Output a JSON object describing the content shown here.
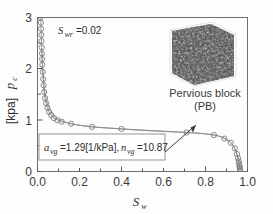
{
  "figure": {
    "background_color": "#fdfdfd",
    "frame_color": "#6f6f6f",
    "curve_color": "#8a8a8a",
    "marker_color": "#7d7d7d"
  },
  "chart_data": {
    "type": "line",
    "title": "",
    "xlabel": "S_w",
    "xlabel_main": "S",
    "xlabel_sub": "w",
    "ylabel": "p_c [kpa]",
    "ylabel_main": "p",
    "ylabel_sub": "c",
    "ylabel_unit": "[kpa]",
    "xlim": [
      0.0,
      1.0
    ],
    "ylim": [
      0,
      3
    ],
    "xticks": [
      0.0,
      0.2,
      0.4,
      0.6,
      0.8,
      1.0
    ],
    "xtick_labels": [
      "0.0",
      "0.2",
      "0.4",
      "0.6",
      "0.8",
      "1.0"
    ],
    "yticks": [
      0,
      1,
      2,
      3
    ],
    "ytick_labels": [
      "0",
      "1",
      "2",
      "3"
    ],
    "grid": false,
    "legend": "none",
    "series": [
      {
        "name": "Drainage branch (upper, dense markers)",
        "x": [
          0.015,
          0.016,
          0.017,
          0.018,
          0.019,
          0.02,
          0.021,
          0.022,
          0.023,
          0.025,
          0.027,
          0.029,
          0.032,
          0.036,
          0.041,
          0.047,
          0.055,
          0.065,
          0.078,
          0.095,
          0.115,
          0.16,
          0.26,
          0.4,
          0.71,
          0.84,
          0.89,
          0.92,
          0.94,
          0.95,
          0.955,
          0.958,
          0.96,
          0.962,
          0.963,
          0.964,
          0.965
        ],
        "y": [
          3.0,
          2.9,
          2.78,
          2.66,
          2.54,
          2.42,
          2.3,
          2.19,
          2.08,
          1.94,
          1.8,
          1.68,
          1.55,
          1.43,
          1.33,
          1.24,
          1.16,
          1.1,
          1.04,
          1.0,
          0.97,
          0.93,
          0.87,
          0.83,
          0.76,
          0.71,
          0.64,
          0.56,
          0.45,
          0.34,
          0.26,
          0.2,
          0.15,
          0.11,
          0.08,
          0.05,
          0.02
        ]
      },
      {
        "name": "Fitted van Genuchten curve",
        "x": [
          0.02,
          0.03,
          0.045,
          0.06,
          0.08,
          0.1,
          0.13,
          0.16,
          0.2,
          0.26,
          0.33,
          0.4,
          0.5,
          0.6,
          0.71,
          0.79,
          0.84,
          0.88,
          0.91,
          0.935,
          0.95,
          0.96,
          0.965
        ],
        "y": [
          2.4,
          1.72,
          1.35,
          1.2,
          1.08,
          1.01,
          0.97,
          0.93,
          0.9,
          0.87,
          0.85,
          0.83,
          0.8,
          0.78,
          0.76,
          0.74,
          0.71,
          0.67,
          0.6,
          0.48,
          0.33,
          0.16,
          0.02
        ]
      }
    ],
    "markers": {
      "shape": "open-circle",
      "radius_px": 2.6,
      "x": [
        0.015,
        0.016,
        0.017,
        0.018,
        0.019,
        0.02,
        0.021,
        0.022,
        0.023,
        0.025,
        0.027,
        0.029,
        0.032,
        0.036,
        0.041,
        0.047,
        0.055,
        0.065,
        0.078,
        0.095,
        0.115,
        0.16,
        0.26,
        0.4,
        0.71,
        0.84,
        0.89,
        0.92,
        0.94,
        0.95,
        0.955,
        0.958,
        0.96,
        0.962,
        0.963,
        0.964,
        0.965
      ],
      "y": [
        3.0,
        2.9,
        2.78,
        2.66,
        2.54,
        2.42,
        2.3,
        2.19,
        2.08,
        1.94,
        1.8,
        1.68,
        1.55,
        1.43,
        1.33,
        1.24,
        1.16,
        1.1,
        1.04,
        1.0,
        0.97,
        0.93,
        0.87,
        0.83,
        0.76,
        0.71,
        0.64,
        0.56,
        0.45,
        0.34,
        0.26,
        0.2,
        0.15,
        0.11,
        0.08,
        0.05,
        0.02
      ]
    },
    "annotations": [
      {
        "id": "residual-saturation",
        "symbol": "S",
        "subscript": "wr",
        "text": "=0.02",
        "full_text": "S_wr = 0.02",
        "value": 0.02
      },
      {
        "id": "van-genuchten-parameters",
        "full_text": "a_vg = 1.29[1/kPa], n_vg = 10.87",
        "symbol_a": "a",
        "subscript_a": "vg",
        "text_a": "=1.29[1/kPa],",
        "symbol_n": "n",
        "subscript_n": "vg",
        "text_n": "=10.87",
        "a_vg": 1.29,
        "a_vg_unit": "1/kPa",
        "n_vg": 10.87,
        "points_to": {
          "x": 0.8,
          "y": 0.755
        }
      }
    ]
  },
  "inset": {
    "name": "pervious-block-render",
    "caption_line1": "Pervious block",
    "caption_line2": "(PB)",
    "description": "3D rendering of porous pervious block microstructure"
  }
}
